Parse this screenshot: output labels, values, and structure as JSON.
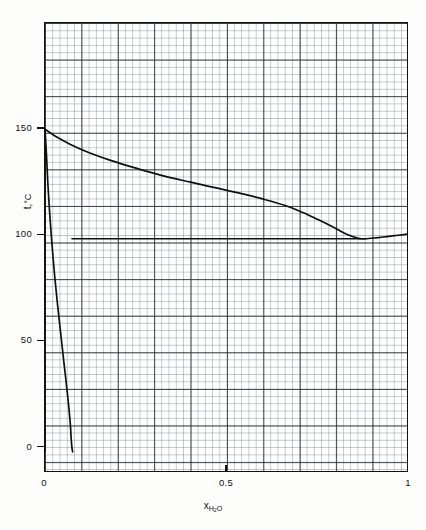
{
  "figure": {
    "background_color": "#fdfdfb",
    "plot_background_color": "#ffffff",
    "frame_color": "#111111",
    "grid_fine_color": "#69737d",
    "grid_major_color": "#232a32",
    "curve_color": "#101010"
  },
  "axes": {
    "y_title_text": "t,",
    "y_title_unit": "°C",
    "x_title_text": "x",
    "x_title_sub": "H",
    "x_title_sub2": "2",
    "x_title_sub3": "O"
  },
  "chart_data": {
    "type": "line",
    "title": "",
    "subtitle": "",
    "xlabel": "x_H2O",
    "ylabel": "t, °C",
    "xlim": [
      0,
      1
    ],
    "ylim": [
      -12,
      200
    ],
    "grid": true,
    "grid_minor": true,
    "legend": "none",
    "x_ticks": [
      0,
      0.5,
      1
    ],
    "x_tick_labels": [
      "0",
      "0.5",
      "1"
    ],
    "y_ticks": [
      0,
      50,
      100,
      150
    ],
    "y_tick_labels": [
      "0",
      "50",
      "100",
      "150"
    ],
    "series": [
      {
        "name": "upper-boundary-dew-curve",
        "role": "vapour-boundary",
        "x": [
          0.0,
          0.03,
          0.07,
          0.12,
          0.18,
          0.25,
          0.32,
          0.4,
          0.47,
          0.54,
          0.6,
          0.66,
          0.71,
          0.75,
          0.79,
          0.82,
          0.845,
          0.865,
          0.88,
          0.91,
          0.94,
          0.97,
          1.0
        ],
        "y": [
          150.0,
          146.5,
          142.8,
          139.0,
          135.3,
          131.6,
          128.2,
          125.0,
          122.3,
          119.6,
          117.0,
          114.0,
          110.6,
          107.4,
          104.0,
          101.2,
          99.4,
          98.4,
          98.3,
          98.8,
          99.4,
          100.0,
          100.6
        ]
      },
      {
        "name": "lower-boundary-bubble-curve",
        "role": "liquid-boundary",
        "x": [
          0.0,
          0.004,
          0.008,
          0.013,
          0.019,
          0.026,
          0.034,
          0.043,
          0.052,
          0.06,
          0.066,
          0.07,
          0.072,
          0.074,
          0.076
        ],
        "y": [
          150.0,
          138.0,
          124.0,
          110.0,
          96.0,
          82.0,
          68.0,
          54.0,
          40.0,
          28.0,
          18.0,
          10.0,
          4.0,
          0.0,
          -2.0
        ]
      },
      {
        "name": "horizontal-boundary-100C",
        "role": "isotherm",
        "x": [
          0.074,
          0.2,
          0.4,
          0.6,
          0.78,
          0.865
        ],
        "y": [
          98.3,
          98.3,
          98.3,
          98.3,
          98.3,
          98.3
        ]
      },
      {
        "name": "left-vertical-boundary",
        "role": "pure-component-edge",
        "x": [
          0.0,
          0.0
        ],
        "y": [
          150.0,
          -2.0
        ]
      },
      {
        "name": "right-vertical-boundary",
        "role": "pure-water-edge",
        "x": [
          1.0,
          1.0
        ],
        "y": [
          100.6,
          88.0
        ]
      }
    ],
    "annotations": [
      {
        "text": "eutectic-minimum",
        "x": 0.865,
        "y": 98.3
      }
    ]
  }
}
